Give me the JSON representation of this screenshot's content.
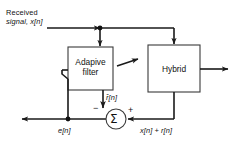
{
  "diagram": {
    "type": "block-diagram",
    "background_color": "#ffffff",
    "line_color": "#1a1a1a",
    "box_stroke_color": "#3a3a3a",
    "box_fill_color": "#ffffff"
  },
  "blocks": [
    {
      "id": "adaptive-filter",
      "label_line1": "Adapive",
      "label_line2": "filter",
      "x": 68,
      "y": 47,
      "width": 45,
      "height": 43
    },
    {
      "id": "hybrid",
      "label_line1": "Hybrid",
      "label_line2": "",
      "x": 148,
      "y": 45,
      "width": 52,
      "height": 47
    }
  ],
  "summer": {
    "id": "summing-junction",
    "symbol": "Σ",
    "plus_sign": "+",
    "minus_sign": "−",
    "cx": 116,
    "cy": 119,
    "r": 10
  },
  "labels": {
    "input_line1": "Received",
    "input_line2": "signal, x[n]",
    "filter_output": "r̂[n]",
    "error": "e[n]",
    "hybrid_output": "x[n] + r[n]"
  },
  "nodes": [
    {
      "id": "input-tap-junction",
      "cx": 100,
      "cy": 28
    },
    {
      "id": "error-tap-junction",
      "cx": 68,
      "cy": 119
    }
  ],
  "arrows": [
    {
      "id": "input-arrow",
      "direction": "right"
    },
    {
      "id": "to-adaptive-filter-arrow",
      "direction": "down"
    },
    {
      "id": "to-hybrid-arrow",
      "direction": "down"
    },
    {
      "id": "adaptation-arrow",
      "direction": "up-right"
    },
    {
      "id": "filter-to-summer-arrow",
      "direction": "down"
    },
    {
      "id": "hybrid-out-arrow",
      "direction": "right"
    },
    {
      "id": "summer-in-right-arrow",
      "direction": "left"
    },
    {
      "id": "error-out-arrow",
      "direction": "left"
    }
  ]
}
